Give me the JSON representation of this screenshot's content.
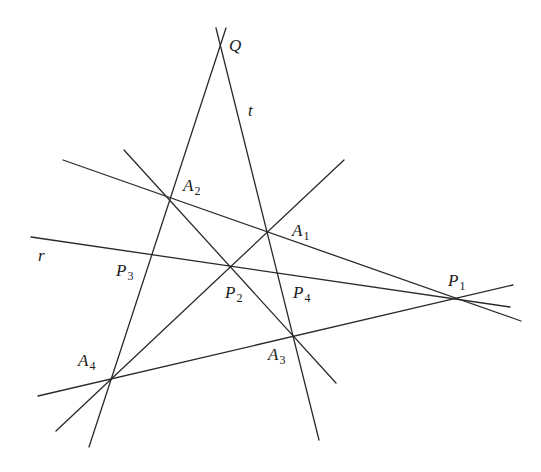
{
  "diagram": {
    "line_color": "#2a2a2a",
    "lines": [
      {
        "id": "QA4",
        "name": "line-q-a2-a4",
        "x1": 226,
        "y1": 28,
        "x2": 89,
        "y2": 447
      },
      {
        "id": "t",
        "name": "line-t-q-a1-a3",
        "x1": 216,
        "y1": 28,
        "x2": 319,
        "y2": 440
      },
      {
        "id": "A2P1",
        "name": "line-a2-a1-p1",
        "x1": 63,
        "y1": 160,
        "x2": 521,
        "y2": 321
      },
      {
        "id": "r",
        "name": "line-r-p3-p2-p4-p1",
        "x1": 31,
        "y1": 237,
        "x2": 510,
        "y2": 307
      },
      {
        "id": "A2A3",
        "name": "line-a2-p2-a3",
        "x1": 124,
        "y1": 150,
        "x2": 336,
        "y2": 383
      },
      {
        "id": "A4A1",
        "name": "line-a4-p2-a1",
        "x1": 56,
        "y1": 431,
        "x2": 344,
        "y2": 160
      },
      {
        "id": "A4P1",
        "name": "line-a4-a3-p1",
        "x1": 38,
        "y1": 396,
        "x2": 513,
        "y2": 285
      }
    ],
    "labels": [
      {
        "name": "label-q",
        "main": "Q",
        "sub": "",
        "x": 229,
        "y": 51
      },
      {
        "name": "label-t",
        "main": "t",
        "sub": "",
        "x": 248,
        "y": 116
      },
      {
        "name": "label-a2",
        "main": "A",
        "sub": "2",
        "x": 183,
        "y": 191
      },
      {
        "name": "label-a1",
        "main": "A",
        "sub": "1",
        "x": 292,
        "y": 236
      },
      {
        "name": "label-r",
        "main": "r",
        "sub": "",
        "x": 38,
        "y": 261
      },
      {
        "name": "label-p3",
        "main": "P",
        "sub": "3",
        "x": 116,
        "y": 276
      },
      {
        "name": "label-p2",
        "main": "P",
        "sub": "2",
        "x": 225,
        "y": 298
      },
      {
        "name": "label-p4",
        "main": "P",
        "sub": "4",
        "x": 293,
        "y": 298
      },
      {
        "name": "label-p1",
        "main": "P",
        "sub": "1",
        "x": 448,
        "y": 286
      },
      {
        "name": "label-a4",
        "main": "A",
        "sub": "4",
        "x": 78,
        "y": 366
      },
      {
        "name": "label-a3",
        "main": "A",
        "sub": "3",
        "x": 268,
        "y": 360
      }
    ]
  }
}
